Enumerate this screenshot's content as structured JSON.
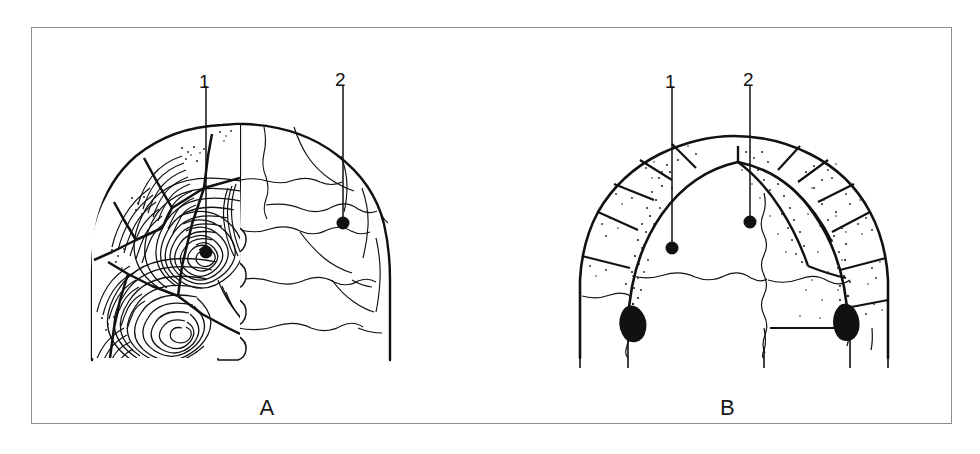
{
  "figure": {
    "panels": [
      {
        "id": "A",
        "caption": "A",
        "view": "dorsal carapace, left half showing growth annuli, right half plain scutes",
        "callouts": [
          {
            "label": "1",
            "label_x": 172,
            "label_y": 46,
            "line_x": 174,
            "line_y1": 58,
            "line_y2": 217,
            "dot_x": 174,
            "dot_y": 224,
            "target": "left-costal-scute-with-annuli"
          },
          {
            "label": "2",
            "label_x": 304,
            "label_y": 44,
            "line_x": 311,
            "line_y1": 58,
            "line_y2": 188,
            "dot_x": 311,
            "dot_y": 195,
            "target": "right-costal-scute-plain"
          }
        ]
      },
      {
        "id": "B",
        "caption": "B",
        "view": "plastron / bridge region with stippled shading",
        "callouts": [
          {
            "label": "1",
            "label_x": 162,
            "label_y": 46,
            "line_x": 170,
            "line_y1": 58,
            "line_y2": 213,
            "dot_x": 170,
            "dot_y": 220,
            "target": "marginal-scute-left"
          },
          {
            "label": "2",
            "label_x": 241,
            "label_y": 44,
            "line_x": 248,
            "line_y1": 58,
            "line_y2": 187,
            "dot_x": 248,
            "dot_y": 194,
            "target": "central-vertebral-scute"
          }
        ]
      }
    ]
  },
  "style": {
    "ink": "#111111",
    "frame_stroke": "#8e8e8e",
    "paper": "#ffffff",
    "stipple": "#222222"
  }
}
